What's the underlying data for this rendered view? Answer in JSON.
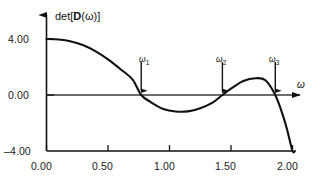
{
  "chart_data": {
    "type": "line",
    "title": "",
    "xlabel": "ω",
    "ylabel": "det[D(ω)]",
    "xlim": [
      0.0,
      2.05
    ],
    "ylim": [
      -4.0,
      5.0
    ],
    "grid": false,
    "legend": "none",
    "x_ticks": [
      {
        "value": 0.0,
        "label": "0.00"
      },
      {
        "value": 0.5,
        "label": "0.50"
      },
      {
        "value": 1.0,
        "label": "1.00"
      },
      {
        "value": 1.5,
        "label": "1.50"
      },
      {
        "value": 2.0,
        "label": "2.00"
      }
    ],
    "y_ticks": [
      {
        "value": 4.0,
        "label": "4.00"
      },
      {
        "value": 0.0,
        "label": "0.00"
      },
      {
        "value": -4.0,
        "label": "–4.00"
      }
    ],
    "series": [
      {
        "name": "det[D(ω)]",
        "color": "#111111",
        "points": [
          [
            0.0,
            4.0
          ],
          [
            0.1,
            3.96
          ],
          [
            0.2,
            3.82
          ],
          [
            0.3,
            3.55
          ],
          [
            0.4,
            3.12
          ],
          [
            0.5,
            2.55
          ],
          [
            0.6,
            1.86
          ],
          [
            0.7,
            1.1
          ],
          [
            0.77,
            0.0
          ],
          [
            0.85,
            -0.52
          ],
          [
            0.95,
            -1.0
          ],
          [
            1.05,
            -1.18
          ],
          [
            1.15,
            -1.17
          ],
          [
            1.25,
            -0.95
          ],
          [
            1.35,
            -0.55
          ],
          [
            1.43,
            0.0
          ],
          [
            1.5,
            0.45
          ],
          [
            1.6,
            1.0
          ],
          [
            1.7,
            1.2
          ],
          [
            1.78,
            1.05
          ],
          [
            1.86,
            0.0
          ],
          [
            1.92,
            -1.4
          ],
          [
            1.96,
            -2.6
          ],
          [
            2.0,
            -4.0
          ],
          [
            2.02,
            -4.0
          ]
        ]
      }
    ],
    "annotations": [
      {
        "name": "omega-1",
        "label": "ω",
        "sub": "1",
        "x": 0.77,
        "arrow_top_y": 2.35,
        "arrow_tip_y": 0.3
      },
      {
        "name": "omega-2",
        "label": "ω",
        "sub": "2",
        "x": 1.43,
        "arrow_top_y": 2.35,
        "arrow_tip_y": 0.3
      },
      {
        "name": "omega-3",
        "label": "ω",
        "sub": "3",
        "x": 1.86,
        "arrow_top_y": 2.35,
        "arrow_tip_y": 0.3
      }
    ]
  },
  "axis": {
    "y_axis_label_prefix": "det[",
    "y_axis_label_bold": "D",
    "y_axis_label_suffix": "(ω)]",
    "x_axis_label": "ω"
  },
  "labels": {
    "y4": "4.00",
    "y0": "0.00",
    "yneg4": "–4.00",
    "x0": "0.00",
    "x050": "0.50",
    "x100": "1.00",
    "x150": "1.50",
    "x200": "2.00",
    "w1": "ω",
    "w1sub": "1",
    "w2": "ω",
    "w2sub": "2",
    "w3": "ω",
    "w3sub": "3"
  }
}
